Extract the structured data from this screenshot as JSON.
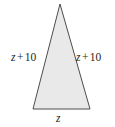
{
  "figure": {
    "type": "isosceles-triangle",
    "fill_color": "#e9e9e9",
    "stroke_color": "#4d4d4d",
    "background_color": "#ffffff",
    "stroke_width": 1,
    "vertices": {
      "apex": [
        60,
        4
      ],
      "bottom_left": [
        33,
        109
      ],
      "bottom_right": [
        90,
        109
      ]
    }
  },
  "labels": {
    "left_side": {
      "full_text": "z + 10",
      "variable": "z",
      "operator": "+",
      "number": "10"
    },
    "right_side": {
      "full_text": "z + 10",
      "variable": "z",
      "operator": "+",
      "number": "10"
    },
    "base": {
      "full_text": "z",
      "variable": "z"
    }
  }
}
